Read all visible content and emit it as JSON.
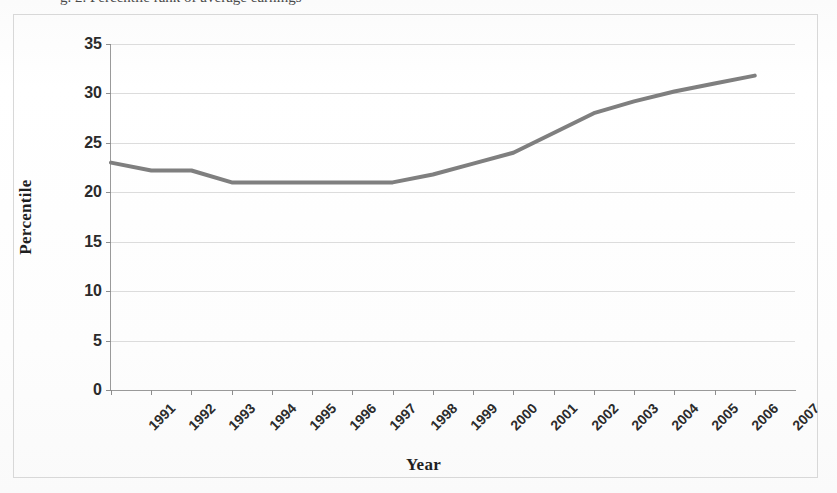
{
  "figure": {
    "caption_remnant": "g. 2. Percentile rank of average earnings",
    "frame_color": "#d8d8d8",
    "background_color": "#fdfdfd"
  },
  "chart_data": {
    "type": "line",
    "title": "",
    "subtitle": "",
    "xlabel": "Year",
    "ylabel": "Percentile",
    "x": [
      1991,
      1992,
      1993,
      1994,
      1995,
      1996,
      1997,
      1998,
      1999,
      2000,
      2001,
      2002,
      2003,
      2004,
      2005,
      2006,
      2007
    ],
    "categories": [
      "1991",
      "1992",
      "1993",
      "1994",
      "1995",
      "1996",
      "1997",
      "1998",
      "1999",
      "2000",
      "2001",
      "2002",
      "2003",
      "2004",
      "2005",
      "2006",
      "2007"
    ],
    "values": [
      23.0,
      22.2,
      22.2,
      21.0,
      21.0,
      21.0,
      21.0,
      21.0,
      21.8,
      22.9,
      24.0,
      26.0,
      28.0,
      29.2,
      30.2,
      31.0,
      31.8
    ],
    "series": [
      {
        "name": "Percentile",
        "color": "#7f7f7f",
        "values": [
          23.0,
          22.2,
          22.2,
          21.0,
          21.0,
          21.0,
          21.0,
          21.0,
          21.8,
          22.9,
          24.0,
          26.0,
          28.0,
          29.2,
          30.2,
          31.0,
          31.8
        ]
      }
    ],
    "ylim": [
      0,
      35
    ],
    "ytick_values": [
      0,
      5,
      10,
      15,
      20,
      25,
      30,
      35
    ],
    "ytick_labels": [
      "0",
      "5",
      "10",
      "15",
      "20",
      "25",
      "30",
      "35"
    ],
    "xtick_labels": [
      "1991",
      "1992",
      "1993",
      "1994",
      "1995",
      "1996",
      "1997",
      "1998",
      "1999",
      "2000",
      "2001",
      "2002",
      "2003",
      "2004",
      "2005",
      "2006",
      "2007"
    ],
    "xtick_rotation_deg": -45,
    "grid": true,
    "grid_axis": "y",
    "grid_color": "#dcdcdc",
    "legend": false,
    "legend_position": "none",
    "line_color": "#7f7f7f",
    "line_width": 4,
    "markers": false,
    "axis_color": "#9a9a9a"
  }
}
